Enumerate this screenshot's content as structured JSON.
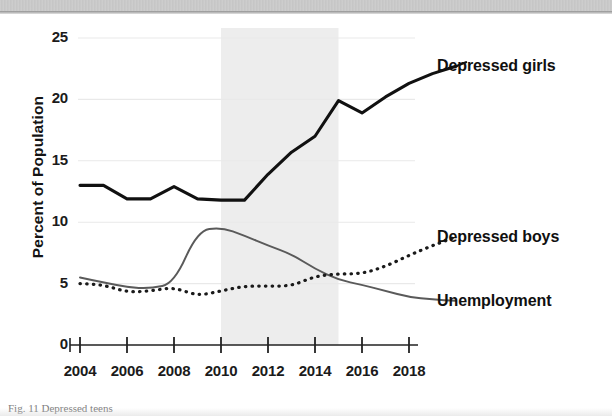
{
  "figure": {
    "caption_fragment": "Fig. 11 Depressed teens"
  },
  "axes": {
    "y_axis_title": "Percent of Population",
    "y_ticks": [
      "0",
      "5",
      "10",
      "15",
      "20",
      "25"
    ],
    "x_ticks": [
      "2004",
      "2006",
      "2008",
      "2010",
      "2012",
      "2014",
      "2016",
      "2018"
    ]
  },
  "series_labels": {
    "girls": "Depressed girls",
    "boys": "Depressed boys",
    "unemployment": "Unemployment"
  },
  "colors": {
    "girls_line": "#111111",
    "boys_line": "#1a1a1a",
    "unemployment_line": "#5a5a5a",
    "shaded_band": "#e6e6e6",
    "gridline": "#e9e9e9",
    "axis": "#222222",
    "text": "#111111"
  },
  "chart_data": {
    "type": "line",
    "title": "",
    "subtitle": "",
    "xlabel": "",
    "ylabel": "Percent of Population",
    "xlim": [
      2004,
      2020
    ],
    "ylim": [
      0,
      25
    ],
    "y_ticks": [
      0,
      5,
      10,
      15,
      20,
      25
    ],
    "x_ticks": [
      2004,
      2006,
      2008,
      2010,
      2012,
      2014,
      2016,
      2018
    ],
    "grid": "horizontal-faint",
    "legend_position": "right-inline-labels",
    "shaded_region": {
      "label": "",
      "x_start": 2010,
      "x_end": 2015,
      "color": "#e6e6e6"
    },
    "x": [
      2004,
      2005,
      2006,
      2007,
      2008,
      2009,
      2010,
      2011,
      2012,
      2013,
      2014,
      2015,
      2016,
      2017,
      2018,
      2019,
      2020
    ],
    "series": [
      {
        "name": "Depressed girls",
        "style": "solid-thick",
        "color": "#111111",
        "values": [
          13.0,
          13.0,
          11.9,
          11.9,
          12.9,
          11.9,
          11.8,
          11.8,
          13.9,
          15.7,
          17.0,
          19.9,
          18.9,
          20.2,
          21.3,
          22.1,
          22.7
        ]
      },
      {
        "name": "Depressed boys",
        "style": "dotted",
        "color": "#1a1a1a",
        "values": [
          5.0,
          4.9,
          4.3,
          4.4,
          4.7,
          4.0,
          4.4,
          4.8,
          4.8,
          4.8,
          5.6,
          5.8,
          5.8,
          6.4,
          7.3,
          8.1,
          8.8
        ]
      },
      {
        "name": "Unemployment",
        "style": "solid-thin",
        "color": "#5a5a5a",
        "values": [
          5.5,
          5.1,
          4.7,
          4.6,
          5.0,
          9.3,
          9.6,
          8.9,
          8.1,
          7.4,
          6.2,
          5.3,
          4.9,
          4.4,
          3.9,
          3.7,
          3.6
        ]
      }
    ]
  }
}
